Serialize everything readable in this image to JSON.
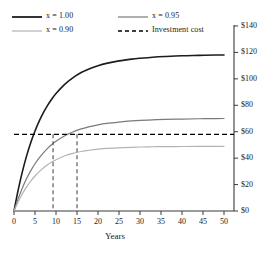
{
  "chart_data": {
    "type": "line",
    "title": "",
    "xlabel": "Years",
    "ylabel": "",
    "xlim": [
      0,
      52
    ],
    "ylim": [
      0,
      140
    ],
    "xticks": [
      0,
      5,
      10,
      15,
      20,
      25,
      30,
      35,
      40,
      45,
      50
    ],
    "xtick_labels": [
      "0",
      "5",
      "10",
      "15",
      "20",
      "25",
      "30",
      "35",
      "40",
      "45",
      "50"
    ],
    "yticks": [
      0,
      20,
      40,
      60,
      80,
      100,
      120,
      140
    ],
    "ytick_labels": [
      "$0",
      "$20",
      "$40",
      "$60",
      "$80",
      "$100",
      "$120",
      "$140"
    ],
    "y_axis_position": "right",
    "grid": false,
    "legend_position": "top-left",
    "series": [
      {
        "name": "x = 1.00",
        "color": "#1c1c1c",
        "width": 1.6,
        "style": "solid",
        "plateau": 118,
        "x": [
          0,
          1,
          2,
          3,
          4,
          5,
          6,
          7,
          8,
          9,
          10,
          12,
          14,
          16,
          18,
          20,
          22,
          25,
          28,
          30,
          33,
          36,
          40,
          44,
          48,
          50
        ],
        "values": [
          0,
          12.0,
          22.3,
          31.2,
          38.8,
          45.3,
          50.9,
          55.7,
          59.8,
          63.4,
          66.5,
          71.6,
          75.4,
          78.4,
          80.6,
          82.3,
          83.6,
          85.0,
          86.0,
          86.5,
          87.1,
          87.5,
          87.9,
          88.1,
          88.3,
          88.3
        ]
      },
      {
        "name": "x = 0.95",
        "color": "#7a7a7a",
        "width": 1.2,
        "style": "solid",
        "plateau": 70,
        "x": [
          0,
          1,
          2,
          3,
          4,
          5,
          6,
          7,
          8,
          9,
          10,
          12,
          14,
          16,
          18,
          20,
          22,
          25,
          28,
          30,
          33,
          36,
          40,
          44,
          48,
          50
        ],
        "values": [
          0,
          9.0,
          16.8,
          23.6,
          29.4,
          34.4,
          38.7,
          42.4,
          45.6,
          48.4,
          50.8,
          54.7,
          57.6,
          59.8,
          61.5,
          62.8,
          63.8,
          64.8,
          65.6,
          66.0,
          66.4,
          66.7,
          67.0,
          67.2,
          67.3,
          67.4
        ]
      },
      {
        "name": "x = 0.90",
        "color": "#b3b3b3",
        "width": 1.2,
        "style": "solid",
        "plateau": 49,
        "x": [
          0,
          1,
          2,
          3,
          4,
          5,
          6,
          7,
          8,
          9,
          10,
          12,
          14,
          16,
          18,
          20,
          22,
          25,
          28,
          30,
          33,
          36,
          40,
          44,
          48,
          50
        ],
        "values": [
          0,
          7.2,
          13.4,
          18.8,
          23.4,
          27.3,
          30.7,
          33.6,
          36.1,
          38.2,
          40.0,
          42.9,
          44.9,
          46.4,
          47.4,
          48.2,
          48.8,
          49.3,
          49.7,
          49.9,
          50.1,
          50.2,
          50.3,
          50.4,
          50.4,
          50.5
        ]
      }
    ],
    "reference_line": {
      "name": "Investment cost",
      "value": 58,
      "color": "#000000",
      "style": "dashed",
      "orientation": "horizontal"
    },
    "payback_markers": [
      {
        "label": "",
        "x": 9.3,
        "y": 58,
        "style": "dashed",
        "color": "#4d4d4d"
      },
      {
        "label": "",
        "x": 15.0,
        "y": 58,
        "style": "dashed",
        "color": "#4d4d4d"
      }
    ],
    "legend": [
      {
        "label": "x = 1.00",
        "color": "#1c1c1c",
        "style": "solid",
        "width": 1.8
      },
      {
        "label": "x = 0.95",
        "color": "#7a7a7a",
        "style": "solid",
        "width": 1.2
      },
      {
        "label": "x = 0.90",
        "color": "#b3b3b3",
        "style": "solid",
        "width": 1.2
      },
      {
        "label": "Investment cost",
        "color": "#000000",
        "style": "dashed",
        "width": 1.6
      }
    ]
  },
  "axis": {
    "x_title": "Years",
    "y_ticks": [
      "$0",
      "$20",
      "$40",
      "$60",
      "$80",
      "$100",
      "$120",
      "$140"
    ],
    "x_ticks": [
      "0",
      "5",
      "10",
      "15",
      "20",
      "25",
      "30",
      "35",
      "40",
      "45",
      "50"
    ]
  },
  "legend": {
    "item0": "x = 1.00",
    "item1": "x = 0.95",
    "item2": "x = 0.90",
    "item3": "Investment cost"
  }
}
